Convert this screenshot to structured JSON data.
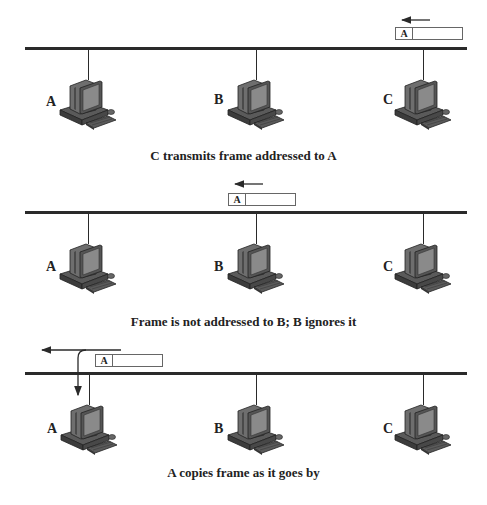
{
  "panels": [
    {
      "caption": "C transmits frame addressed to A",
      "frame": {
        "address": "A",
        "direction": "left"
      },
      "nodes": [
        {
          "label": "A"
        },
        {
          "label": "B"
        },
        {
          "label": "C"
        }
      ]
    },
    {
      "caption": "Frame is not addressed to B; B ignores it",
      "frame": {
        "address": "A",
        "direction": "left"
      },
      "nodes": [
        {
          "label": "A"
        },
        {
          "label": "B"
        },
        {
          "label": "C"
        }
      ]
    },
    {
      "caption": "A copies frame as it goes by",
      "frame": {
        "address": "A",
        "direction": "left"
      },
      "nodes": [
        {
          "label": "A"
        },
        {
          "label": "B"
        },
        {
          "label": "C"
        }
      ]
    }
  ],
  "colors": {
    "line": "#2a2a2a",
    "frame_border": "#666666",
    "pc_body": "#6e6e6e",
    "pc_dark": "#3c3c3c",
    "pc_screen": "#8a8a8a"
  }
}
